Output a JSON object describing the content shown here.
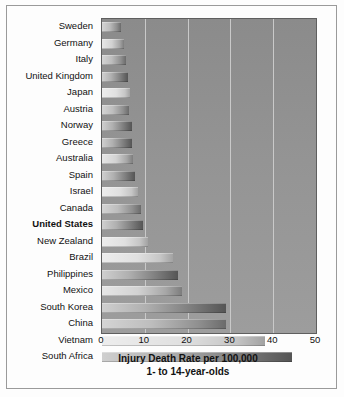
{
  "chart_data": {
    "type": "bar",
    "orientation": "horizontal",
    "title": "",
    "xlabel": "Injury Death Rate per 100,000",
    "xlabel_line2": "1- to 14-year-olds",
    "ylabel": "",
    "xlim": [
      0,
      50
    ],
    "xticks": [
      0,
      10,
      20,
      30,
      40,
      50
    ],
    "xtick_labels": [
      "0",
      "10",
      "20",
      "30",
      "40",
      "50"
    ],
    "grid": "vertical gridlines at 10, 20, 30, 40",
    "legend": "none",
    "highlighted_category": "United States",
    "categories": [
      "Sweden",
      "Germany",
      "Italy",
      "United Kingdom",
      "Japan",
      "Austria",
      "Norway",
      "Greece",
      "Australia",
      "Spain",
      "Israel",
      "Canada",
      "United States",
      "New Zealand",
      "Brazil",
      "Philippines",
      "Mexico",
      "South Korea",
      "China",
      "Vietnam",
      "South Africa"
    ],
    "values": [
      4.4,
      5.2,
      5.6,
      6.1,
      6.6,
      6.3,
      7.0,
      7.1,
      7.3,
      7.8,
      8.4,
      9.0,
      9.5,
      10.8,
      16.7,
      17.7,
      18.7,
      28.9,
      29.0,
      38.0,
      44.5
    ],
    "bars": [
      {
        "label": "Sweden",
        "value": 4.4,
        "tone": "g-a"
      },
      {
        "label": "Germany",
        "value": 5.2,
        "tone": "g-b"
      },
      {
        "label": "Italy",
        "value": 5.6,
        "tone": "g-a"
      },
      {
        "label": "United Kingdom",
        "value": 6.1,
        "tone": "g-c"
      },
      {
        "label": "Japan",
        "value": 6.6,
        "tone": "g-d"
      },
      {
        "label": "Austria",
        "value": 6.3,
        "tone": "g-a"
      },
      {
        "label": "Norway",
        "value": 7.0,
        "tone": "g-c"
      },
      {
        "label": "Greece",
        "value": 7.1,
        "tone": "g-c"
      },
      {
        "label": "Australia",
        "value": 7.3,
        "tone": "g-b"
      },
      {
        "label": "Spain",
        "value": 7.8,
        "tone": "g-c"
      },
      {
        "label": "Israel",
        "value": 8.4,
        "tone": "g-d"
      },
      {
        "label": "Canada",
        "value": 9.0,
        "tone": "g-a"
      },
      {
        "label": "United States",
        "value": 9.5,
        "tone": "g-c",
        "bold": true
      },
      {
        "label": "New Zealand",
        "value": 10.8,
        "tone": "g-d"
      },
      {
        "label": "Brazil",
        "value": 16.7,
        "tone": "g-d"
      },
      {
        "label": "Philippines",
        "value": 17.7,
        "tone": "g-c"
      },
      {
        "label": "Mexico",
        "value": 18.7,
        "tone": "g-b"
      },
      {
        "label": "South Korea",
        "value": 28.9,
        "tone": "g-c"
      },
      {
        "label": "China",
        "value": 29.0,
        "tone": "g-a"
      },
      {
        "label": "Vietnam",
        "value": 38.0,
        "tone": "g-d"
      },
      {
        "label": "South Africa",
        "value": 44.5,
        "tone": "g-c"
      }
    ]
  },
  "colors": {
    "plot_background": "#949494",
    "gridline": "#c9c9c9",
    "axis_line": "#5f5f5f",
    "frame": "#9a9a9a",
    "page_background": "#fdfdfd",
    "text": "#111111"
  }
}
